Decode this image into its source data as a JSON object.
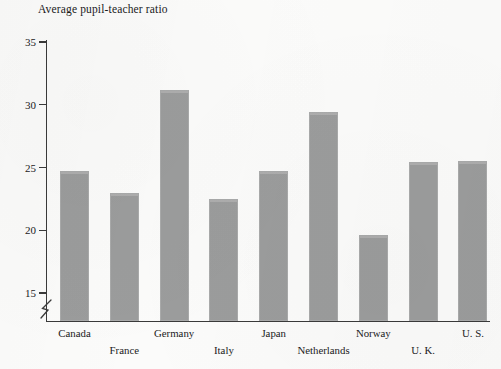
{
  "chart_data": {
    "type": "bar",
    "title": "Average pupil-teacher ratio",
    "xlabel": "",
    "ylabel": "",
    "categories": [
      "Canada",
      "France",
      "Germany",
      "Italy",
      "Japan",
      "Netherlands",
      "Norway",
      "U. K.",
      "U. S."
    ],
    "values": [
      24.7,
      23.0,
      31.2,
      22.5,
      24.7,
      29.4,
      19.6,
      25.4,
      25.5
    ],
    "ylim": [
      13.8,
      35.6
    ],
    "yticks": [
      15,
      20,
      25,
      30,
      35
    ],
    "ytick_labels": [
      "15",
      "20",
      "25",
      "30",
      "35"
    ],
    "grid": false,
    "legend": null,
    "axis_break": true,
    "axis_break_note": "zigzag break on y-axis below 15",
    "bar_color": "#9b9c9c",
    "axis_color": "#3a3a3a",
    "background_color": "#fbfbfa",
    "label_rows": [
      0,
      1,
      0,
      1,
      0,
      1,
      0,
      1,
      0
    ]
  }
}
